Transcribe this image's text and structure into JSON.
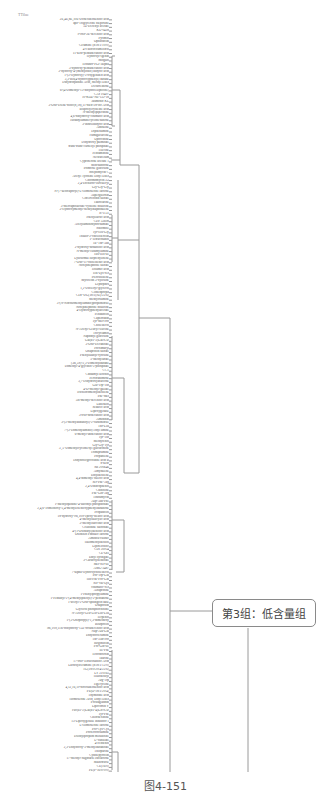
{
  "figure": {
    "header_label": "TTilue",
    "group_box_label": "第3组：低含量组",
    "caption": "图4-151",
    "line_color": "#9a9a9a"
  },
  "dendrogram": {
    "orientation": "horizontal, labels on left, root on right",
    "leaves": [
      "2E,4E,8E,10E-Dodecatetraenoic acid",
      "apo-Triglyceride diepoxide",
      "5Z-Decenyl acetate",
      "KU-0418",
      "9-oxo-2E-decenoic acid",
      "Pyrimol",
      "Ophiobolin",
      "Ceramide (d18:1/10:0)",
      "4-Fluorocoumestrol",
      "11-keto-pentadecanoic acid",
      "Hydroxyl-Igenin",
      "Shogaol",
      "Tetranor-PGF1alpha",
      "3-hydroxy-pentadecanoic acid",
      "2-hydroxy-4-(methylthio) butyric acid",
      "1-(3-Hydroxy)-3-oxygenated acid",
      "3,3-Bis(4-hydroxyphenyl) butane",
      "Dihydroquinine Acid, Methyl Ester",
      "Decaffeinone",
      "6-(4-Dimethyl-13-dihydroellipticine)",
      "CAY10497",
      "10-KOZ-NE-132-18",
      "Jasmonic KL",
      "3-Oxo-Diene-dioic(8,18),11-dien-28-oic Acid",
      "Bisprolylcysteine acid",
      "N-Methylpiperidine",
      "4,6-dihydroxy-coumaric acid",
      "Isobutylamidecyclohexanone",
      "3-Indolebutyric acid",
      "Athraline",
      "Diphenamide",
      "Fumigaclavine",
      "Uprocidine",
      "Dihydroxy palmitate",
      "trans-trans-Farnesyl phosphate",
      "Tilecine",
      "Pentamidine",
      "Nefiracetam",
      "Cyproterone acetate 1",
      "Mitoxantrone",
      "Primrose glucoside",
      "Streptimycin C",
      "Acetyl Tyrosine Ethyl Ester",
      "Chromomycin A3",
      "2,4-Dichloro-Isovaleryl",
      "Gly-Gly-Gly",
      "N-(7-ketocaproyl)-L-Homoserine lactone",
      "Aspergilloxin",
      "Citreoviridin sulfate",
      "Taurolarine",
      "3-Mercaptolactate-cysteine disulfide",
      "3-Hydroxymethyl-benzylnaphthalene",
      "R-1131",
      "Phenyllactic acid",
      "CDP 32608",
      "Acetylaminohydroxamate",
      "Shiomole",
      "Tyr-His-Gly",
      "Thiazo-2-cholesterolin",
      "1-Tetracosanol",
      "Ile-Thr-Asn",
      "2-hydroxy-nonadioic acid",
      "N-methyl-Isoamylamine",
      "His-His-Ile",
      "Lysosomal Isoprenylidene",
      "7-Oxo-11-cholestenic acid",
      "Norepinephrine sulfate",
      "Tiflamic acid",
      "His-Lys-Ser",
      "Pterostilbene",
      "Myricetin 3-xyloside",
      "Leptophos",
      "1,2-Dioleoyl-glycerol",
      "Clobenpropit",
      "CDP-DG(18:1(9Z)/22:6)",
      "Methyoxamide",
      "3-(N-Nitrosomethylamino)propionitrile",
      "Norepinephrine disulfide",
      "4-Hydroxyphenylacetate",
      "Penbutolol",
      "Capsorubin",
      "Tyr-Met-Pro",
      "Cholesterol",
      "N-Acetyl-Leucyl-leucine",
      "Tricyclamol",
      "Naphthyl glucoside",
      "Gal(b1-3)GalNAc",
      "3-Oxo-Decanoate",
      "Proximaryl",
      "Oxaprozin sulfate",
      "Phenylalanyl-tyrosine",
      "5-Methylurate",
      "(3R,5S)-2,3-Dimethylbutane",
      "Dimethyl-4-glycinol-5-phosphate",
      "CCT",
      "Cinnamyl alcohol",
      "Perforatumone",
      "3,7-Dihydroxyaflavone",
      "Glu-Trp-Thr",
      "4-O-Methyl-gallate",
      "Trichloromethylbenzene",
      "Phe-Met",
      "5R-methyl-decenoic acid",
      "Labetalol",
      "Sebacic acid",
      "Lipoxygenase",
      "3-oxo-dodecanoic acid",
      "Amidinin",
      "3-(3-Methylbutanoyl)-2-carbonitrile",
      "Thr-Leu",
      "7-(2-Dimethylamino) ethyl amine",
      "6-methyl-undecanoic acid",
      "Tyr-Thr",
      "Methyrenol",
      "Gly-Gly-Tyr",
      "3',5'-Dimethylcyclohexyl glucuronide",
      "Trimipramine",
      "Propadiene",
      "Dihydroergocristine acid B",
      "8-keto",
      "SB 200646",
      "Amydalene",
      "Ethylbenzene",
      "4,4-dimethyl valeric acid",
      "Ser-Phe-Arg",
      "2,4-Dinitrophenol",
      "Chinoline",
      "Phe-Gln-Arg",
      "Tobramycin",
      "Asp-Asn-Phe",
      "1-Methylquinine-4-sulfonyl phosphonate",
      "2,4,6-Trimethoxy-3,4-methylenedioxyphenylbutanone",
      "Propanolol",
      "18-hydroxy-9R,10S-epoxy-stearic acid",
      "4-Methylsalicylic acid",
      "3-Methylsuccinic acid",
      "Creatinine sulfonate",
      "4-(1-Oxobutyl)benzoic acid",
      "Oxidized Phthalic lactone",
      "Aminolevulinic",
      "Halomethylbenzol",
      "Lipoteichoic",
      "CDI 30954",
      "CE-OH",
      "Ethyl syringate",
      "3-Carboxybenzoate",
      "Met-Ser-Ile",
      "AMG-2487",
      "7-alpha-Hydroxycholesterol",
      "Pro-Trp-Glu",
      "His-Phe-Pro-Gln",
      "Ser-Val-Lys",
      "coumaric-Ser",
      "Alfaprotine",
      "1-Phenylpropylamine",
      "1-Pentanyl-2-(4-methylphenyl)-2-pentanone",
      "1-acetyl-2-Oxo-sphingoid base",
      "Oxaprozin",
      "Glycerol phosphocholine",
      "N-Acetyl-Leu-Leu-Leu-Leu",
      "Terpenol",
      "1-(3-Oxopropyl)-1,3-dimethoxy",
      "Bisoprolol",
      "9R,10S,11R-trihydroxy-12Z-octadecenoic acid",
      "Nap-Ala-Glu",
      "Dihydroceramide",
      "Thr-Asn-Pro",
      "Isogoniolin",
      "Pro-Gln-Ile",
      "Ile-Phe",
      "Tetrodotoxin",
      "Taurine",
      "17-oxo-Tetracosanoic Acid",
      "Lactosylceramide (d18:1/12:0)",
      "TG(18:0/20:4/22:6)",
      "LY 310165",
      "Halobenzyl",
      "Arg-Trp",
      "Tigecycline",
      "4,12,16,19-docosatetraenoic acid",
      "PE(O-18:1/20:4)",
      "Thymidine acid",
      "Homoserine Acid, Ethyl Ester",
      "Prostaglandin",
      "Lipocortin V",
      "Fuc(a1-2)Gal(b1-4)GlcNAc",
      "Tyr-Phe",
      "Chlorhexidine",
      "15-Lipoxygenase Inhibitor 1",
      "L-Homoserine lactone",
      "Pro-Cys-Cys",
      "Proferrorosamine",
      "Diethylpropion metabolite",
      "L-Vanillate",
      "4-Pentenol",
      "2,3-Dihydroxy-3-methylbutanoate",
      "Thiopurine",
      "Cysthepyrrolin",
      "17-Methyl-Sagittaris enolactone",
      "Maltotriose",
      "CE(16:0)",
      "PE(P-16:0/0:0)"
    ]
  }
}
